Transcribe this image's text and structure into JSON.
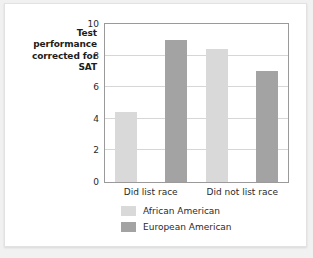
{
  "chart_data": {
    "type": "bar",
    "title": "",
    "subtitle": "",
    "xlabel": "",
    "ylabel": "Test performance corrected for SAT",
    "ylim": [
      0,
      10
    ],
    "ytick_step": 2,
    "yticks": [
      "0",
      "2",
      "4",
      "6",
      "8",
      "10"
    ],
    "grid": true,
    "legend_position": "bottom-center",
    "categories": [
      "Did list race",
      "Did not list race"
    ],
    "series": [
      {
        "name": "African American",
        "color": "#d9d9d9",
        "values": [
          4.4,
          8.4
        ]
      },
      {
        "name": "European American",
        "color": "#a3a3a3",
        "values": [
          9.0,
          7.0
        ]
      }
    ]
  },
  "colors": {
    "page_background": "#f1f1f1",
    "card_background": "#ffffff",
    "axis_line": "#9a9a9a",
    "gridline": "#d6d6d6",
    "text": "#2a2a2a",
    "series_light": "#d9d9d9",
    "series_dark": "#a3a3a3"
  }
}
